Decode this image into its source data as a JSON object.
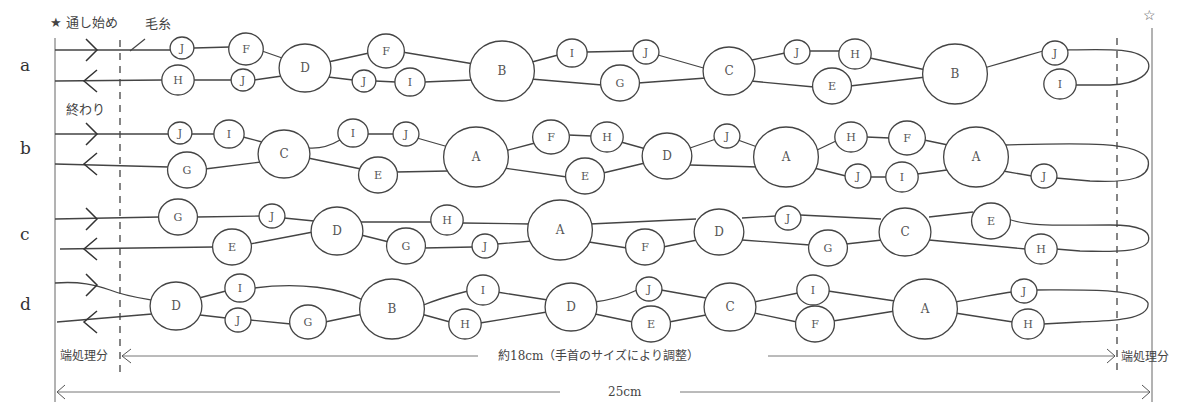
{
  "labels": {
    "start": "★ 通し始め",
    "yarn": "毛糸",
    "end": "終わり",
    "star_right": "☆",
    "edge_left": "端処理分",
    "edge_right": "端処理分",
    "middle_dim": "約18cm（手首のサイズにより調整）",
    "total_dim": "25cm"
  },
  "rows": [
    {
      "id": "a",
      "label": "a",
      "y_top": 50,
      "y_bot": 80,
      "nodes": [
        {
          "l": "J",
          "x": 182,
          "y": 48,
          "r": 11
        },
        {
          "l": "F",
          "x": 246,
          "y": 49,
          "r": 16
        },
        {
          "l": "H",
          "x": 178,
          "y": 80,
          "r": 15
        },
        {
          "l": "J",
          "x": 243,
          "y": 80,
          "r": 11
        },
        {
          "l": "D",
          "x": 305,
          "y": 68,
          "r": 24
        },
        {
          "l": "F",
          "x": 386,
          "y": 51,
          "r": 17
        },
        {
          "l": "J",
          "x": 364,
          "y": 81,
          "r": 11
        },
        {
          "l": "I",
          "x": 410,
          "y": 82,
          "r": 14
        },
        {
          "l": "B",
          "x": 502,
          "y": 71,
          "r": 30
        },
        {
          "l": "I",
          "x": 572,
          "y": 53,
          "r": 14
        },
        {
          "l": "J",
          "x": 646,
          "y": 52,
          "r": 12
        },
        {
          "l": "G",
          "x": 620,
          "y": 83,
          "r": 18
        },
        {
          "l": "C",
          "x": 729,
          "y": 71,
          "r": 24
        },
        {
          "l": "J",
          "x": 797,
          "y": 52,
          "r": 12
        },
        {
          "l": "H",
          "x": 855,
          "y": 54,
          "r": 15
        },
        {
          "l": "E",
          "x": 832,
          "y": 86,
          "r": 18
        },
        {
          "l": "B",
          "x": 955,
          "y": 74,
          "r": 30
        },
        {
          "l": "J",
          "x": 1055,
          "y": 53,
          "r": 12
        },
        {
          "l": "I",
          "x": 1060,
          "y": 84,
          "r": 15
        }
      ],
      "top_path": "M55,50 L170,50 M194,48 L230,47 M262,51 L285,59 M328,62 L369,53 M402,52 L474,64 M532,62 L558,55 M586,52 L634,51 M658,55 L707,69 M752,60 L785,53 M809,51 L840,51 M870,58 L926,70 M984,68 L1043,51 M1067,50 C1110,49 1140,48 1148,62 C1152,72 1140,84 1110,85 L1075,85",
      "bot_path": "M55,81 L163,80 M193,80 L231,80 M254,80 L282,76 M328,77 L353,80 M375,81 L396,82 M424,82 L472,80 M531,79 L602,85 M638,83 L706,78 M751,81 L814,87 M850,86 L926,77"
    },
    {
      "id": "b",
      "label": "b",
      "y_top": 133,
      "y_bot": 163,
      "nodes": [
        {
          "l": "J",
          "x": 180,
          "y": 133,
          "r": 11
        },
        {
          "l": "I",
          "x": 229,
          "y": 134,
          "r": 14
        },
        {
          "l": "G",
          "x": 187,
          "y": 170,
          "r": 18
        },
        {
          "l": "C",
          "x": 284,
          "y": 154,
          "r": 24
        },
        {
          "l": "I",
          "x": 353,
          "y": 133,
          "r": 14
        },
        {
          "l": "J",
          "x": 406,
          "y": 134,
          "r": 12
        },
        {
          "l": "E",
          "x": 378,
          "y": 175,
          "r": 18
        },
        {
          "l": "A",
          "x": 476,
          "y": 157,
          "r": 30
        },
        {
          "l": "F",
          "x": 551,
          "y": 137,
          "r": 17
        },
        {
          "l": "H",
          "x": 607,
          "y": 137,
          "r": 15
        },
        {
          "l": "E",
          "x": 585,
          "y": 176,
          "r": 18
        },
        {
          "l": "D",
          "x": 667,
          "y": 156,
          "r": 23
        },
        {
          "l": "J",
          "x": 727,
          "y": 136,
          "r": 12
        },
        {
          "l": "A",
          "x": 786,
          "y": 157,
          "r": 30
        },
        {
          "l": "H",
          "x": 851,
          "y": 137,
          "r": 15
        },
        {
          "l": "F",
          "x": 907,
          "y": 138,
          "r": 17
        },
        {
          "l": "J",
          "x": 858,
          "y": 176,
          "r": 12
        },
        {
          "l": "I",
          "x": 902,
          "y": 177,
          "r": 15
        },
        {
          "l": "A",
          "x": 976,
          "y": 157,
          "r": 30
        },
        {
          "l": "J",
          "x": 1044,
          "y": 176,
          "r": 12
        }
      ],
      "top_path": "M55,134 L169,134 M191,134 L215,134 M243,137 L262,142 M308,148 C320,149 330,146 340,140 M367,134 L394,134 M417,138 L452,148 M505,151 L535,143 M568,135 L592,136 M621,142 L646,149 M690,148 L716,139 M738,140 L760,148 M815,151 L836,141 M866,137 L890,138 M924,140 L948,145 M1005,145 C1080,143 1140,141 1148,160 C1152,178 1130,183 1090,181 L1056,178",
      "bot_path": "M55,164 L169,167 M205,169 L261,162 M308,158 L361,169 M396,172 L448,171 M504,168 L567,177 M603,173 L645,163 M690,165 L758,167 M814,168 L846,176 M870,177 L887,177 M917,174 L947,170 M1003,171 L1032,176"
    },
    {
      "id": "c",
      "label": "c",
      "y_top": 219,
      "y_bot": 249,
      "nodes": [
        {
          "l": "G",
          "x": 178,
          "y": 217,
          "r": 18
        },
        {
          "l": "J",
          "x": 272,
          "y": 216,
          "r": 12
        },
        {
          "l": "E",
          "x": 232,
          "y": 247,
          "r": 18
        },
        {
          "l": "D",
          "x": 337,
          "y": 231,
          "r": 24
        },
        {
          "l": "H",
          "x": 447,
          "y": 220,
          "r": 15
        },
        {
          "l": "G",
          "x": 406,
          "y": 246,
          "r": 18
        },
        {
          "l": "J",
          "x": 485,
          "y": 246,
          "r": 12
        },
        {
          "l": "A",
          "x": 560,
          "y": 230,
          "r": 30
        },
        {
          "l": "F",
          "x": 645,
          "y": 247,
          "r": 18
        },
        {
          "l": "D",
          "x": 719,
          "y": 232,
          "r": 23
        },
        {
          "l": "J",
          "x": 788,
          "y": 218,
          "r": 12
        },
        {
          "l": "G",
          "x": 828,
          "y": 248,
          "r": 18
        },
        {
          "l": "C",
          "x": 905,
          "y": 232,
          "r": 24
        },
        {
          "l": "E",
          "x": 991,
          "y": 221,
          "r": 18
        },
        {
          "l": "H",
          "x": 1041,
          "y": 249,
          "r": 15
        }
      ],
      "top_path": "M55,219 L160,217 M196,217 L260,216 M284,218 L314,221 M361,222 L432,222 M462,223 L530,224 M590,224 L696,219 M742,218 L776,216 M800,215 L881,219 M929,217 L973,212 M1008,219 C1030,227 1060,225 1110,225 C1140,225 1152,231 1148,242 C1142,252 1115,252 1080,251 L1056,249",
      "bot_path": "M60,249 L214,247 M250,244 L313,232 M361,235 L389,242 M424,248 L473,247 M497,244 L532,241 M589,242 L627,248 M663,247 L697,240 M742,240 L810,245 M846,244 L882,240 M929,240 L1026,249"
    },
    {
      "id": "d",
      "label": "d",
      "y_top": 285,
      "y_bot": 322,
      "nodes": [
        {
          "l": "D",
          "x": 176,
          "y": 306,
          "r": 24
        },
        {
          "l": "I",
          "x": 240,
          "y": 288,
          "r": 14
        },
        {
          "l": "J",
          "x": 238,
          "y": 320,
          "r": 12
        },
        {
          "l": "G",
          "x": 308,
          "y": 322,
          "r": 17
        },
        {
          "l": "B",
          "x": 392,
          "y": 309,
          "r": 30
        },
        {
          "l": "I",
          "x": 483,
          "y": 290,
          "r": 15
        },
        {
          "l": "H",
          "x": 465,
          "y": 324,
          "r": 15
        },
        {
          "l": "D",
          "x": 571,
          "y": 307,
          "r": 24
        },
        {
          "l": "J",
          "x": 649,
          "y": 289,
          "r": 12
        },
        {
          "l": "E",
          "x": 651,
          "y": 324,
          "r": 18
        },
        {
          "l": "C",
          "x": 730,
          "y": 307,
          "r": 24
        },
        {
          "l": "I",
          "x": 813,
          "y": 290,
          "r": 15
        },
        {
          "l": "F",
          "x": 815,
          "y": 324,
          "r": 18
        },
        {
          "l": "A",
          "x": 925,
          "y": 309,
          "r": 30
        },
        {
          "l": "J",
          "x": 1024,
          "y": 291,
          "r": 12
        },
        {
          "l": "H",
          "x": 1028,
          "y": 324,
          "r": 15
        }
      ],
      "top_path": "M55,283 C80,281 95,285 110,290 C125,296 140,298 152,300 M199,298 L226,291 M254,288 C300,282 340,288 363,300 M421,306 C440,298 460,293 468,291 M497,292 L548,300 M594,302 C610,300 625,296 637,290 M661,290 L706,298 M754,302 L798,293 M828,291 L895,301 M955,302 C980,298 1000,293 1012,292 M1036,290 C1080,290 1140,288 1148,303 C1150,320 1110,321 1080,322 L1043,324",
      "bot_path": "M57,322 L152,314 M200,315 L226,318 M250,320 L291,324 M325,322 L363,314 M421,314 L450,322 M480,323 L547,312 M595,314 L633,322 M669,322 L706,315 M754,313 L797,322 M833,321 L895,311 M955,313 L1013,322"
    }
  ],
  "arrows": {
    "rows": [
      {
        "y_top": 50,
        "y_bot": 81
      },
      {
        "y_top": 134,
        "y_bot": 164
      },
      {
        "y_top": 219,
        "y_bot": 249
      },
      {
        "y_top": 285,
        "y_bot": 322
      }
    ]
  }
}
